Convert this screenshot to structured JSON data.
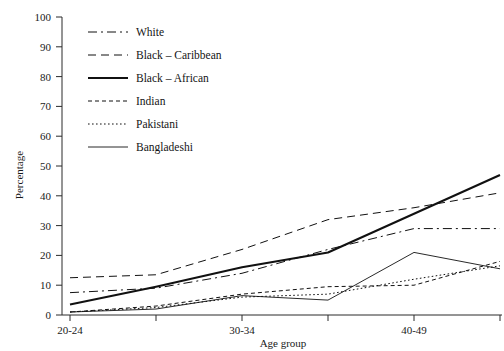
{
  "chart_data": {
    "type": "line",
    "title": "",
    "xlabel": "Age group",
    "ylabel": "Percentage",
    "ylim": [
      0,
      100
    ],
    "ytick_step": 10,
    "yticks": [
      0,
      10,
      20,
      30,
      40,
      50,
      60,
      70,
      80,
      90,
      100
    ],
    "grid": false,
    "legend_position": "upper-left-inside",
    "x": [
      "20-24",
      "25-29",
      "30-34",
      "35-39",
      "40-49",
      "50+"
    ],
    "xtick_labels_visible": [
      "20-24",
      "30-34",
      "40-49"
    ],
    "categories": [
      "20-24",
      "25-29",
      "30-34",
      "35-39",
      "40-49",
      "50+"
    ],
    "series": [
      {
        "name": "White",
        "style": "dash-dot",
        "values": [
          7.5,
          9.0,
          14.0,
          22.0,
          29.0,
          29.0
        ]
      },
      {
        "name": "Black – Caribbean",
        "style": "dashed",
        "values": [
          12.5,
          13.5,
          22.0,
          32.0,
          36.0,
          41.0
        ]
      },
      {
        "name": "Black – African",
        "style": "solid-bold",
        "values": [
          3.5,
          9.5,
          16.0,
          21.0,
          34.0,
          47.0
        ]
      },
      {
        "name": "Indian",
        "style": "medium-dash",
        "values": [
          1.0,
          3.0,
          7.0,
          9.5,
          10.0,
          18.0
        ]
      },
      {
        "name": "Pakistani",
        "style": "dotted",
        "values": [
          1.0,
          2.5,
          6.0,
          7.0,
          12.0,
          16.5
        ]
      },
      {
        "name": "Bangladeshi",
        "style": "solid-thin",
        "values": [
          1.0,
          2.0,
          6.5,
          5.0,
          21.0,
          15.5
        ]
      }
    ]
  },
  "legend": {
    "items": [
      {
        "label": "White"
      },
      {
        "label": "Black – Caribbean"
      },
      {
        "label": "Black – African"
      },
      {
        "label": "Indian"
      },
      {
        "label": "Pakistani"
      },
      {
        "label": "Bangladeshi"
      }
    ]
  },
  "axes": {
    "y_title": "Percentage",
    "x_title": "Age group",
    "y_tick_labels": [
      "0",
      "10",
      "20",
      "30",
      "40",
      "50",
      "60",
      "70",
      "80",
      "90",
      "100"
    ],
    "x_tick_labels": [
      "20-24",
      "30-34",
      "40-49"
    ]
  },
  "colors": {
    "line": "#111111",
    "axis": "#2b2b2b",
    "text": "#141414",
    "background": "#ffffff"
  }
}
